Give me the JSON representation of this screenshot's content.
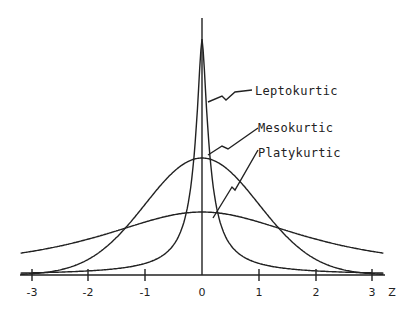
{
  "chart_data": {
    "type": "line",
    "title": "",
    "xlabel": "Z",
    "ylabel": "",
    "x_ticks": [
      "-3",
      "-2",
      "-1",
      "0",
      "1",
      "2",
      "3"
    ],
    "xlim": [
      -3.2,
      3.2
    ],
    "grid": false,
    "series": [
      {
        "name": "Leptokurtic",
        "description": "tall narrow peak"
      },
      {
        "name": "Mesokurtic",
        "description": "normal curve"
      },
      {
        "name": "Platykurtic",
        "description": "flat wide curve"
      }
    ]
  },
  "labels": {
    "leptokurtic": "Leptokurtic",
    "mesokurtic": "Mesokurtic",
    "platykurtic": "Platykurtic",
    "axis_z": "Z"
  },
  "ticks": [
    "-3",
    "-2",
    "-1",
    "0",
    "1",
    "2",
    "3"
  ]
}
